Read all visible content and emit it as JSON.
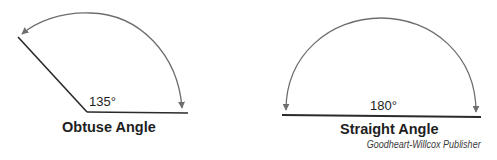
{
  "diagrams": [
    {
      "name": "obtuse",
      "angle_label": "135°",
      "title": "Obtuse Angle",
      "angle_degrees": 135
    },
    {
      "name": "straight",
      "angle_label": "180°",
      "title": "Straight Angle",
      "angle_degrees": 180
    }
  ],
  "credit": "Goodheart-Willcox Publisher",
  "colors": {
    "ray": "#2a2a2a",
    "arc": "#6e6e6e",
    "text": "#1e1e1e"
  }
}
